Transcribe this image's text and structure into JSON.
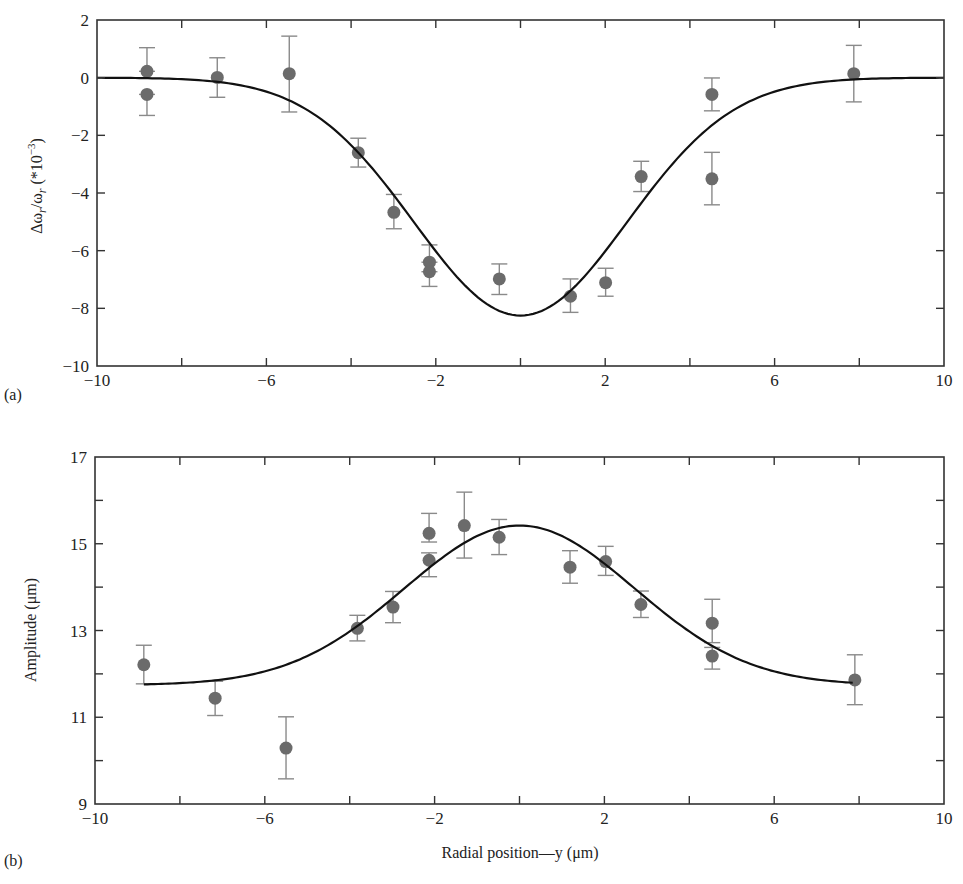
{
  "figure": {
    "panels": [
      {
        "id": "a",
        "label": "(a)"
      },
      {
        "id": "b",
        "label": "(b)"
      }
    ],
    "shared_xlabel": "Radial position—y (μm)"
  },
  "style": {
    "marker_color": "#6b6b6b",
    "errorbar_color": "#8a8a8a",
    "curve_color": "#111111",
    "axis_color": "#333333"
  },
  "chart_data": [
    {
      "type": "scatter",
      "panel": "(a)",
      "title": "",
      "xlabel": "",
      "ylabel": "Δωr/ωr (*10^-3)",
      "ylabel_parts": {
        "main": "Δω",
        "sub1": "r",
        "mid": "/ω",
        "sub2": "r",
        "pre_exp": " (*10",
        "exp": "−3",
        "post": ")"
      },
      "xlim": [
        -10,
        10
      ],
      "ylim": [
        -10,
        2
      ],
      "xticks": [
        -10,
        -8,
        -6,
        -4,
        -2,
        0,
        2,
        4,
        6,
        8,
        10
      ],
      "xtick_labels": [
        "−10",
        "",
        "−6",
        "",
        "−2",
        "",
        "2",
        "",
        "6",
        "",
        "10"
      ],
      "yticks": [
        2,
        0,
        -2,
        -4,
        -6,
        -8,
        -10
      ],
      "ytick_labels": [
        "2",
        "0",
        "−2",
        "−4",
        "−6",
        "−8",
        "−10"
      ],
      "grid": false,
      "legend": null,
      "series": [
        {
          "name": "measured",
          "kind": "points_with_errorbars",
          "points": [
            {
              "x": -8.82,
              "y": 0.22,
              "err_hi": 1.04,
              "err_lo": 0.22
            },
            {
              "x": -8.82,
              "y": -0.58,
              "err_hi": -0.58,
              "err_lo": -1.31
            },
            {
              "x": -7.16,
              "y": 0.01,
              "err_hi": 0.69,
              "err_lo": -0.68
            },
            {
              "x": -5.46,
              "y": 0.14,
              "err_hi": 1.44,
              "err_lo": -1.19
            },
            {
              "x": -3.83,
              "y": -2.6,
              "err_hi": -2.1,
              "err_lo": -3.1
            },
            {
              "x": -2.99,
              "y": -4.67,
              "err_hi": -4.05,
              "err_lo": -5.24
            },
            {
              "x": -2.15,
              "y": -6.4,
              "err_hi": -5.8,
              "err_lo": -6.4
            },
            {
              "x": -2.15,
              "y": -6.73,
              "err_hi": -6.73,
              "err_lo": -7.24
            },
            {
              "x": -0.5,
              "y": -6.98,
              "err_hi": -6.46,
              "err_lo": -7.52
            },
            {
              "x": 1.18,
              "y": -7.58,
              "err_hi": -6.98,
              "err_lo": -8.14
            },
            {
              "x": 2.01,
              "y": -7.11,
              "err_hi": -6.61,
              "err_lo": -7.58
            },
            {
              "x": 2.85,
              "y": -3.43,
              "err_hi": -2.9,
              "err_lo": -3.95
            },
            {
              "x": 4.52,
              "y": -0.58,
              "err_hi": -0.01,
              "err_lo": -1.15
            },
            {
              "x": 4.52,
              "y": -3.51,
              "err_hi": -2.59,
              "err_lo": -4.41
            },
            {
              "x": 7.87,
              "y": 0.14,
              "err_hi": 1.12,
              "err_lo": -0.84
            }
          ]
        },
        {
          "name": "gaussian fit",
          "kind": "curve",
          "model": "gaussian",
          "baseline": 0.0,
          "amplitude": -8.25,
          "center": 0.0,
          "sigma": 2.52,
          "x_range": [
            -10,
            10
          ]
        }
      ]
    },
    {
      "type": "scatter",
      "panel": "(b)",
      "title": "",
      "xlabel": "Radial position—y (μm)",
      "ylabel": "Amplitude (μm)",
      "xlim": [
        -10,
        10
      ],
      "ylim": [
        9,
        17
      ],
      "xticks": [
        -10,
        -8,
        -6,
        -4,
        -2,
        0,
        2,
        4,
        6,
        8,
        10
      ],
      "xtick_labels": [
        "−10",
        "",
        "−6",
        "",
        "−2",
        "",
        "2",
        "",
        "6",
        "",
        "10"
      ],
      "yticks": [
        17,
        16,
        15,
        14,
        13,
        12,
        11,
        10,
        9
      ],
      "ytick_labels": [
        "17",
        "",
        "15",
        "",
        "13",
        "",
        "11",
        "",
        "9"
      ],
      "grid": false,
      "legend": null,
      "series": [
        {
          "name": "measured",
          "kind": "points_with_errorbars",
          "points": [
            {
              "x": -8.85,
              "y": 12.21,
              "err_hi": 12.66,
              "err_lo": 11.77
            },
            {
              "x": -7.17,
              "y": 11.44,
              "err_hi": 11.83,
              "err_lo": 11.04
            },
            {
              "x": -5.5,
              "y": 10.29,
              "err_hi": 11.01,
              "err_lo": 9.58
            },
            {
              "x": -3.82,
              "y": 13.05,
              "err_hi": 13.35,
              "err_lo": 12.76
            },
            {
              "x": -2.98,
              "y": 13.54,
              "err_hi": 13.9,
              "err_lo": 13.18
            },
            {
              "x": -2.13,
              "y": 15.24,
              "err_hi": 15.7,
              "err_lo": 15.04
            },
            {
              "x": -2.13,
              "y": 14.62,
              "err_hi": 14.79,
              "err_lo": 14.24
            },
            {
              "x": -1.3,
              "y": 15.42,
              "err_hi": 16.19,
              "err_lo": 14.67
            },
            {
              "x": -0.48,
              "y": 15.15,
              "err_hi": 15.56,
              "err_lo": 14.75
            },
            {
              "x": 1.19,
              "y": 14.46,
              "err_hi": 14.84,
              "err_lo": 14.09
            },
            {
              "x": 2.03,
              "y": 14.59,
              "err_hi": 14.94,
              "err_lo": 14.27
            },
            {
              "x": 2.86,
              "y": 13.6,
              "err_hi": 13.91,
              "err_lo": 13.3
            },
            {
              "x": 4.54,
              "y": 13.17,
              "err_hi": 13.72,
              "err_lo": 12.72
            },
            {
              "x": 4.54,
              "y": 12.41,
              "err_hi": 12.61,
              "err_lo": 12.11
            },
            {
              "x": 7.9,
              "y": 11.86,
              "err_hi": 12.44,
              "err_lo": 11.29
            }
          ]
        },
        {
          "name": "gaussian fit",
          "kind": "curve",
          "model": "gaussian",
          "baseline": 11.74,
          "amplitude": 3.68,
          "center": 0.0,
          "sigma": 2.71,
          "x_range": [
            -8.85,
            7.85
          ]
        }
      ]
    }
  ]
}
